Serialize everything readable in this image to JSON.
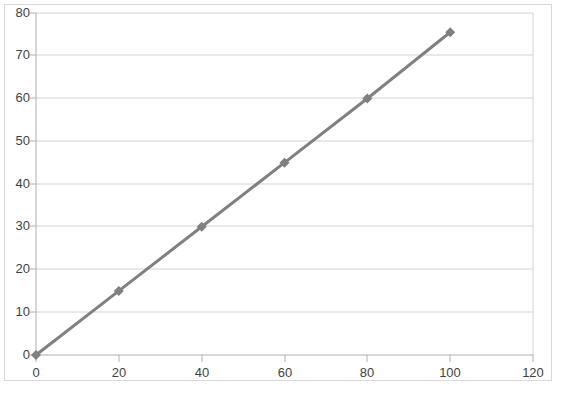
{
  "chart_data": {
    "type": "line",
    "title": "",
    "subtitle": "",
    "xlabel": "",
    "ylabel": "",
    "x": [
      0,
      20,
      40,
      60,
      80,
      100
    ],
    "series": [
      {
        "name": "Series1",
        "values": [
          0,
          15,
          30,
          45,
          60,
          75.5
        ],
        "color": "#808080",
        "marker": "diamond",
        "line_width": 3
      }
    ],
    "xlim": [
      0,
      120
    ],
    "ylim": [
      0,
      80
    ],
    "xticks": [
      0,
      20,
      40,
      60,
      80,
      100,
      120
    ],
    "yticks": [
      0,
      10,
      20,
      30,
      40,
      50,
      60,
      70,
      80
    ],
    "xtick_labels": [
      "0",
      "20",
      "40",
      "60",
      "80",
      "100",
      "120"
    ],
    "ytick_labels": [
      "0",
      "10",
      "20",
      "30",
      "40",
      "50",
      "60",
      "70",
      "80"
    ],
    "grid": {
      "horizontal": true,
      "vertical": false,
      "color": "#d4d4d4"
    },
    "legend": {
      "visible": false,
      "position": "none",
      "entries": []
    },
    "axis_line_color": "#b0b0b0",
    "plot_background": "#ffffff",
    "frame_color": "#d9d9d9",
    "annotations": []
  }
}
